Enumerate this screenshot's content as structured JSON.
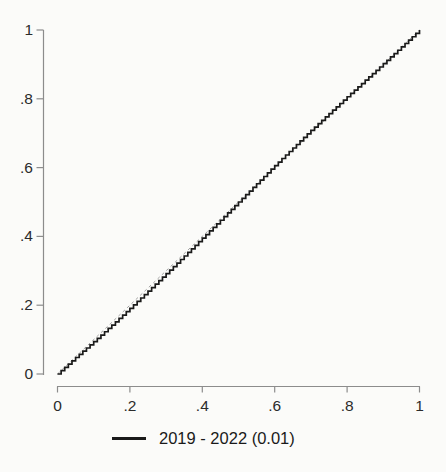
{
  "page": {
    "background": "#fbfbf9"
  },
  "chart_data": {
    "type": "line",
    "subtype": "quantile-step-plot",
    "title": "",
    "xlabel": "",
    "ylabel": "",
    "xlim": [
      0,
      1
    ],
    "ylim": [
      0,
      1
    ],
    "grid": false,
    "x_ticks": [
      {
        "value": 0,
        "label": "0"
      },
      {
        "value": 0.2,
        "label": ".2"
      },
      {
        "value": 0.4,
        "label": ".4"
      },
      {
        "value": 0.6,
        "label": ".6"
      },
      {
        "value": 0.8,
        "label": ".8"
      },
      {
        "value": 1,
        "label": "1"
      }
    ],
    "y_ticks": [
      {
        "value": 0,
        "label": "0"
      },
      {
        "value": 0.2,
        "label": ".2"
      },
      {
        "value": 0.4,
        "label": ".4"
      },
      {
        "value": 0.6,
        "label": ".6"
      },
      {
        "value": 0.8,
        "label": ".8"
      },
      {
        "value": 1,
        "label": "1"
      }
    ],
    "reference_line": {
      "from": [
        0,
        0
      ],
      "to": [
        1,
        1
      ],
      "style": "dashed",
      "color": "#a3a3a3"
    },
    "legend": {
      "position": "bottom",
      "items": [
        {
          "label": "2019 - 2022 (0.01)",
          "color": "#1a1a1a",
          "marker": "line"
        }
      ]
    },
    "series": [
      {
        "name": "2019 - 2022 (0.01)",
        "step_size": 0.01,
        "color": "#1a1a1a",
        "points": [
          [
            0,
            0
          ],
          [
            0.05,
            0.048
          ],
          [
            0.1,
            0.094
          ],
          [
            0.15,
            0.142
          ],
          [
            0.2,
            0.191
          ],
          [
            0.25,
            0.241
          ],
          [
            0.3,
            0.292
          ],
          [
            0.35,
            0.343
          ],
          [
            0.4,
            0.395
          ],
          [
            0.45,
            0.447
          ],
          [
            0.5,
            0.5
          ],
          [
            0.55,
            0.553
          ],
          [
            0.6,
            0.606
          ],
          [
            0.65,
            0.657
          ],
          [
            0.7,
            0.708
          ],
          [
            0.75,
            0.757
          ],
          [
            0.8,
            0.806
          ],
          [
            0.85,
            0.854
          ],
          [
            0.9,
            0.902
          ],
          [
            0.95,
            0.951
          ],
          [
            1,
            1
          ]
        ]
      }
    ],
    "colors": {
      "axis": "#8c8c8c",
      "tick_label": "#2b2b2b",
      "curve": "#1a1a1a",
      "reference": "#a3a3a3"
    }
  }
}
